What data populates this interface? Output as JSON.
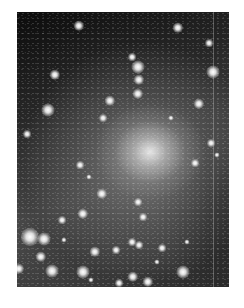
{
  "image": {
    "description": "Grayscale astronomical photograph of a dense star cluster with a bright diffuse core, scattered bright stars, on a white page margin",
    "photo_bounds": {
      "x": 17,
      "y": 12,
      "width": 212,
      "height": 275
    },
    "core_center": {
      "x": 150,
      "y": 152
    },
    "colors": {
      "page": "#ffffff",
      "sky_dark": "#0c0c0c",
      "sky_mid": "#4a4a4a",
      "core": "#ebebeb"
    },
    "stars": [
      {
        "x": 62,
        "y": 14,
        "r": 4
      },
      {
        "x": 161,
        "y": 16,
        "r": 4
      },
      {
        "x": 192,
        "y": 31,
        "r": 3
      },
      {
        "x": 115,
        "y": 45,
        "r": 3
      },
      {
        "x": 121,
        "y": 55,
        "r": 5
      },
      {
        "x": 196,
        "y": 60,
        "r": 5
      },
      {
        "x": 38,
        "y": 63,
        "r": 4
      },
      {
        "x": 122,
        "y": 68,
        "r": 4
      },
      {
        "x": 121,
        "y": 82,
        "r": 4
      },
      {
        "x": 93,
        "y": 89,
        "r": 4
      },
      {
        "x": 182,
        "y": 92,
        "r": 4
      },
      {
        "x": 31,
        "y": 98,
        "r": 5
      },
      {
        "x": 86,
        "y": 106,
        "r": 3
      },
      {
        "x": 154,
        "y": 106,
        "r": 2
      },
      {
        "x": 10,
        "y": 122,
        "r": 3
      },
      {
        "x": 194,
        "y": 131,
        "r": 3
      },
      {
        "x": 63,
        "y": 153,
        "r": 3
      },
      {
        "x": 178,
        "y": 151,
        "r": 3
      },
      {
        "x": 72,
        "y": 165,
        "r": 2
      },
      {
        "x": 85,
        "y": 182,
        "r": 4
      },
      {
        "x": 121,
        "y": 190,
        "r": 3
      },
      {
        "x": 126,
        "y": 205,
        "r": 3
      },
      {
        "x": 66,
        "y": 202,
        "r": 4
      },
      {
        "x": 45,
        "y": 208,
        "r": 3
      },
      {
        "x": 13,
        "y": 225,
        "r": 7
      },
      {
        "x": 27,
        "y": 227,
        "r": 5
      },
      {
        "x": 47,
        "y": 228,
        "r": 2
      },
      {
        "x": 115,
        "y": 230,
        "r": 3
      },
      {
        "x": 122,
        "y": 233,
        "r": 3
      },
      {
        "x": 145,
        "y": 236,
        "r": 3
      },
      {
        "x": 78,
        "y": 240,
        "r": 4
      },
      {
        "x": 99,
        "y": 238,
        "r": 3
      },
      {
        "x": 24,
        "y": 245,
        "r": 4
      },
      {
        "x": 35,
        "y": 259,
        "r": 5
      },
      {
        "x": 66,
        "y": 260,
        "r": 5
      },
      {
        "x": 166,
        "y": 260,
        "r": 5
      },
      {
        "x": 116,
        "y": 265,
        "r": 4
      },
      {
        "x": 131,
        "y": 270,
        "r": 4
      },
      {
        "x": 102,
        "y": 271,
        "r": 3
      },
      {
        "x": 74,
        "y": 268,
        "r": 2
      },
      {
        "x": 2,
        "y": 257,
        "r": 4
      },
      {
        "x": 200,
        "y": 143,
        "r": 2
      },
      {
        "x": 140,
        "y": 250,
        "r": 2
      },
      {
        "x": 170,
        "y": 230,
        "r": 2
      }
    ]
  }
}
